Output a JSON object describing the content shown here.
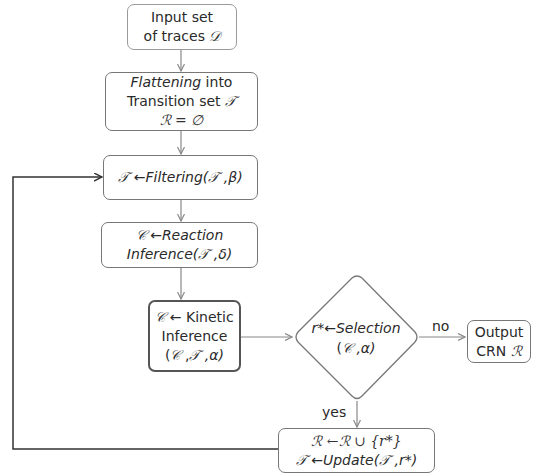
{
  "diagram": {
    "nodes": {
      "input": {
        "line1": "Input set",
        "line2_text": "of traces ",
        "line2_symbol": "𝒟"
      },
      "flatten": {
        "line1_italic": "Flattening",
        "line1_rest": " into",
        "line2_text": "Transition set ",
        "line2_symbol": "𝒯",
        "line3": "ℛ = ∅"
      },
      "filter": {
        "lhs": "𝒯",
        "arrow": " ←",
        "func": "Filtering(",
        "arg1": "𝒯",
        "rest": " ,β)"
      },
      "reaction": {
        "lhs": "𝒞",
        "arrow": " ←",
        "func": "Reaction",
        "line2_func": "Inference(",
        "arg1": "𝒯",
        "rest": " ,δ)"
      },
      "kinetic": {
        "lhs": "𝒞",
        "line1_rest": " ← Kinetic",
        "line2": "Inference",
        "line3_open": "(",
        "arg1": "𝒞",
        "sep1": " ,",
        "arg2": "𝒯",
        "rest": " ,α)"
      },
      "selection": {
        "lhs": "r*",
        "arrow": "←",
        "func": "Selection",
        "line2_open": "(",
        "arg1": "𝒞",
        "rest": " ,α)"
      },
      "output": {
        "line1": "Output",
        "line2_text": "CRN ",
        "line2_symbol": "ℛ"
      },
      "update": {
        "line1": "ℛ ←ℛ ∪ {r*}",
        "line2_lhs": "𝒯",
        "line2_arrow": " ←",
        "line2_func": "Update(",
        "line2_arg1": "𝒯",
        "line2_rest": " ,r*)"
      }
    },
    "edge_labels": {
      "no": "no",
      "yes": "yes"
    },
    "colors": {
      "edge": "#888888",
      "loop": "#333333",
      "border": "#777777"
    }
  }
}
